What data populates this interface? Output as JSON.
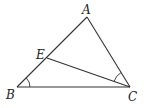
{
  "diagram": {
    "type": "triangle-geometry",
    "points": {
      "A": {
        "label": "A",
        "x": 87,
        "y": 17,
        "label_x": 82,
        "label_y": 14
      },
      "B": {
        "label": "B",
        "x": 17,
        "y": 87,
        "label_x": 6,
        "label_y": 99
      },
      "C": {
        "label": "C",
        "x": 130,
        "y": 87,
        "label_x": 128,
        "label_y": 101
      },
      "E": {
        "label": "E",
        "x": 47,
        "y": 58,
        "label_x": 36,
        "label_y": 60
      }
    },
    "segments": [
      {
        "name": "segment-AB",
        "from": "A",
        "to": "B"
      },
      {
        "name": "segment-AC",
        "from": "A",
        "to": "C"
      },
      {
        "name": "segment-BC",
        "from": "B",
        "to": "C"
      },
      {
        "name": "segment-EC",
        "from": "E",
        "to": "C"
      }
    ],
    "angle_marks": [
      {
        "name": "angle-B-mark",
        "vertex": "B",
        "between": [
          "E",
          "C"
        ]
      },
      {
        "name": "angle-ACE-mark",
        "vertex": "C",
        "between": [
          "A",
          "E"
        ]
      }
    ],
    "colors": {
      "line": "#333333",
      "text": "#222222",
      "background": "#ffffff"
    }
  }
}
